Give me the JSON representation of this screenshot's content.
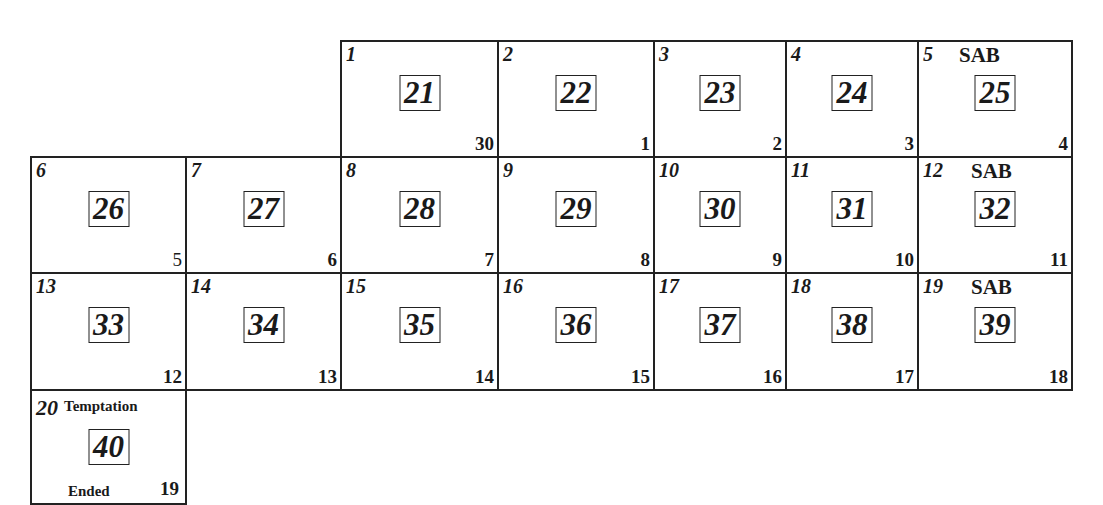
{
  "calendar": {
    "cells": [
      {
        "day": "1",
        "boxed": "21",
        "corner": "30",
        "label": ""
      },
      {
        "day": "2",
        "boxed": "22",
        "corner": "1",
        "label": ""
      },
      {
        "day": "3",
        "boxed": "23",
        "corner": "2",
        "label": ""
      },
      {
        "day": "4",
        "boxed": "24",
        "corner": "3",
        "label": ""
      },
      {
        "day": "5",
        "boxed": "25",
        "corner": "4",
        "label": "SAB"
      },
      {
        "day": "6",
        "boxed": "26",
        "corner": "5",
        "label": ""
      },
      {
        "day": "7",
        "boxed": "27",
        "corner": "6",
        "label": ""
      },
      {
        "day": "8",
        "boxed": "28",
        "corner": "7",
        "label": ""
      },
      {
        "day": "9",
        "boxed": "29",
        "corner": "8",
        "label": ""
      },
      {
        "day": "10",
        "boxed": "30",
        "corner": "9",
        "label": ""
      },
      {
        "day": "11",
        "boxed": "31",
        "corner": "10",
        "label": ""
      },
      {
        "day": "12",
        "boxed": "32",
        "corner": "11",
        "label": "SAB"
      },
      {
        "day": "13",
        "boxed": "33",
        "corner": "12",
        "label": ""
      },
      {
        "day": "14",
        "boxed": "34",
        "corner": "13",
        "label": ""
      },
      {
        "day": "15",
        "boxed": "35",
        "corner": "14",
        "label": ""
      },
      {
        "day": "16",
        "boxed": "36",
        "corner": "15",
        "label": ""
      },
      {
        "day": "17",
        "boxed": "37",
        "corner": "16",
        "label": ""
      },
      {
        "day": "18",
        "boxed": "38",
        "corner": "17",
        "label": ""
      },
      {
        "day": "19",
        "boxed": "39",
        "corner": "18",
        "label": "SAB"
      },
      {
        "day": "20",
        "boxed": "40",
        "corner": "19",
        "label": "Temptation",
        "footer": "Ended"
      }
    ]
  }
}
